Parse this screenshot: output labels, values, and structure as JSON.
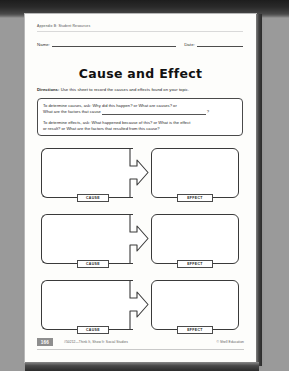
{
  "document": {
    "appendix_label": "Appendix B: Student Resources",
    "name_label": "Name:",
    "date_label": "Date:",
    "title": "Cause and Effect",
    "directions_prefix": "Directions:",
    "directions_text": " Use this sheet to record the causes and effects found on your topic.",
    "prompt_box": {
      "cause_prompt_part1": "To determine causes, ask: Why did this happen? or What are causes? or",
      "cause_prompt_part2": "What are the factors that cause",
      "cause_prompt_end": "?",
      "effect_prompt_part1": "To determine effects, ask: What happened because of this? or What is the effect",
      "effect_prompt_part2": "or result? or What are the factors that resulted from this cause?"
    },
    "organizer": {
      "cause_label": "CAUSE",
      "effect_label": "EFFECT",
      "row_count": 3
    },
    "footer": {
      "page_number": "166",
      "center_credit": "#50212—Think It, Show It: Social Studies",
      "copyright": "© Shell Education"
    }
  },
  "colors": {
    "page_background": "#fdfdfb",
    "ink": "#1f1f1f",
    "border": "#3a3a3a",
    "pagenum_badge": "#8e8e8e",
    "scan_background": "#2b2b2b"
  }
}
